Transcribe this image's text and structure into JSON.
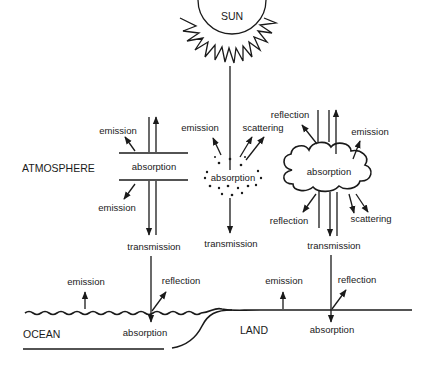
{
  "diagram": {
    "sun": {
      "label": "SUN"
    },
    "regions": {
      "atmosphere": "ATMOSPHERE",
      "ocean": "OCEAN",
      "land": "LAND"
    },
    "gas_layer": {
      "center": "absorption",
      "emission_up": "emission",
      "emission_down": "emission",
      "transmission": "transmission"
    },
    "aerosol": {
      "center": "absorption",
      "emission": "emission",
      "scattering": "scattering",
      "transmission": "transmission"
    },
    "cloud": {
      "center": "absorption",
      "reflection_top": "reflection",
      "emission": "emission",
      "reflection_bottom": "reflection",
      "scattering": "scattering",
      "transmission": "transmission"
    },
    "ocean_surface": {
      "emission": "emission",
      "reflection": "reflection",
      "absorption": "absorption"
    },
    "land_surface": {
      "emission": "emission",
      "reflection": "reflection",
      "absorption": "absorption"
    }
  }
}
